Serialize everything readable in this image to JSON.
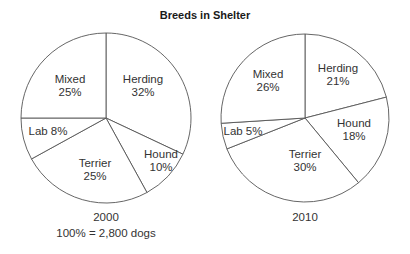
{
  "title": "Breeds in Shelter",
  "pies": [
    {
      "year": "2000",
      "note": "100% = 2,800 dogs",
      "center": [
        106,
        118
      ],
      "radius": 85,
      "slices": [
        {
          "name": "Herding",
          "pct": 32,
          "label1": "Herding",
          "label2": "32%",
          "lx": 143,
          "ly": 83
        },
        {
          "name": "Hound",
          "pct": 10,
          "label1": "Hound",
          "label2": "10%",
          "lx": 161,
          "ly": 158
        },
        {
          "name": "Terrier",
          "pct": 25,
          "label1": "Terrier",
          "label2": "25%",
          "lx": 95,
          "ly": 167
        },
        {
          "name": "Lab",
          "pct": 8,
          "label1": "Lab 8%",
          "label2": "",
          "lx": 48,
          "ly": 135
        },
        {
          "name": "Mixed",
          "pct": 25,
          "label1": "Mixed",
          "label2": "25%",
          "lx": 70,
          "ly": 83
        }
      ]
    },
    {
      "year": "2010",
      "note": "",
      "center": [
        305,
        118
      ],
      "radius": 84,
      "slices": [
        {
          "name": "Herding",
          "pct": 21,
          "label1": "Herding",
          "label2": "21%",
          "lx": 338,
          "ly": 72
        },
        {
          "name": "Hound",
          "pct": 18,
          "label1": "Hound",
          "label2": "18%",
          "lx": 354,
          "ly": 127
        },
        {
          "name": "Terrier",
          "pct": 30,
          "label1": "Terrier",
          "label2": "30%",
          "lx": 305,
          "ly": 158
        },
        {
          "name": "Lab",
          "pct": 5,
          "label1": "Lab 5%",
          "label2": "",
          "lx": 243,
          "ly": 135
        },
        {
          "name": "Mixed",
          "pct": 26,
          "label1": "Mixed",
          "label2": "26%",
          "lx": 268,
          "ly": 78
        }
      ]
    }
  ],
  "chart_data": [
    {
      "type": "pie",
      "title": "Breeds in Shelter",
      "subtitle": "2000",
      "annotation": "100% = 2,800 dogs",
      "categories": [
        "Herding",
        "Hound",
        "Terrier",
        "Lab",
        "Mixed"
      ],
      "values": [
        32,
        10,
        25,
        8,
        25
      ],
      "unit": "%",
      "start_angle": "12 o'clock",
      "direction": "clockwise",
      "legend": "none (labels inside slices)"
    },
    {
      "type": "pie",
      "title": "Breeds in Shelter",
      "subtitle": "2010",
      "categories": [
        "Herding",
        "Hound",
        "Terrier",
        "Lab",
        "Mixed"
      ],
      "values": [
        21,
        18,
        30,
        5,
        26
      ],
      "unit": "%",
      "start_angle": "12 o'clock",
      "direction": "clockwise",
      "legend": "none (labels inside slices)"
    }
  ]
}
